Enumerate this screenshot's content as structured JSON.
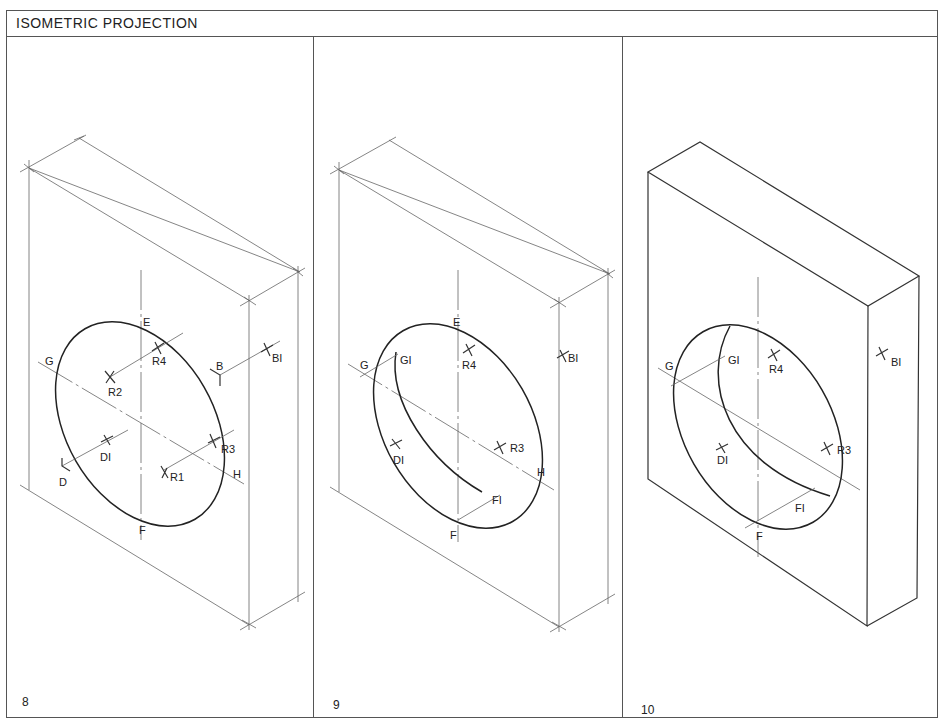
{
  "title": "ISOMETRIC PROJECTION",
  "panels": [
    {
      "number": "8",
      "labels": {
        "E": "E",
        "F": "F",
        "G": "G",
        "H": "H",
        "R1": "R1",
        "R2": "R2",
        "R3": "R3",
        "R4": "R4",
        "B": "B",
        "B1": "BI",
        "D": "D",
        "D1": "DI"
      }
    },
    {
      "number": "9",
      "labels": {
        "E": "E",
        "F": "F",
        "G": "G",
        "H": "H",
        "G1": "GI",
        "F1": "FI",
        "R3": "R3",
        "R4": "R4",
        "B1": "BI",
        "D1": "DI"
      }
    },
    {
      "number": "10",
      "labels": {
        "F": "F",
        "G": "G",
        "G1": "GI",
        "F1": "FI",
        "R3": "R3",
        "R4": "R4",
        "B1": "BI",
        "D1": "DI"
      }
    }
  ]
}
